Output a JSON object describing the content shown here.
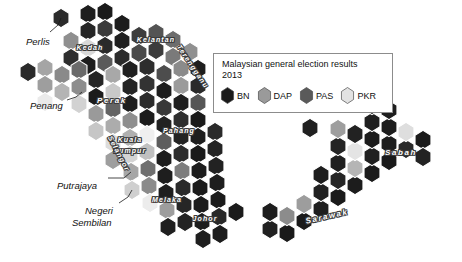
{
  "legend": {
    "title_line1": "Malaysian general election results",
    "title_line2": "2013",
    "items": [
      {
        "label": "BN",
        "color": "#1a1a1a"
      },
      {
        "label": "DAP",
        "color": "#9a9a9a"
      },
      {
        "label": "PAS",
        "color": "#5a5a5a"
      },
      {
        "label": "PKR",
        "color": "#e2e2e2"
      }
    ]
  },
  "labels_outside": [
    {
      "name": "perlis",
      "text": "Perlis",
      "x": 26,
      "y": 36,
      "w": 40
    },
    {
      "name": "penang",
      "text": "Penang",
      "x": 30,
      "y": 100,
      "w": 46
    },
    {
      "name": "putrajaya",
      "text": "Putrajaya",
      "x": 57,
      "y": 180,
      "w": 54
    },
    {
      "name": "negeri-sembilan-1",
      "text": "Negeri",
      "x": 85,
      "y": 205,
      "w": 44
    },
    {
      "name": "negeri-sembilan-2",
      "text": "Sembilan",
      "x": 72,
      "y": 217,
      "w": 58
    }
  ],
  "labels_inside": [
    {
      "name": "kedah",
      "text": "Kedah",
      "x": 66,
      "y": 44,
      "w": 48,
      "rot": 0,
      "size": "sm"
    },
    {
      "name": "kelantan",
      "text": "Kelantan",
      "x": 127,
      "y": 36,
      "w": 58,
      "rot": 0,
      "size": "sm"
    },
    {
      "name": "terengganu",
      "text": "Terengganu",
      "x": 160,
      "y": 63,
      "w": 66,
      "rot": 56,
      "size": "sm"
    },
    {
      "name": "perak",
      "text": "Perak",
      "x": 88,
      "y": 96,
      "w": 48,
      "rot": 0,
      "size": ""
    },
    {
      "name": "pahang",
      "text": "Pahang",
      "x": 153,
      "y": 127,
      "w": 52,
      "rot": 0,
      "size": "sm"
    },
    {
      "name": "kuala-lumpur-1",
      "text": "Kuala",
      "x": 111,
      "y": 136,
      "w": 38,
      "rot": 0,
      "size": "sm"
    },
    {
      "name": "kuala-lumpur-2",
      "text": "Lumpur",
      "x": 107,
      "y": 147,
      "w": 46,
      "rot": 0,
      "size": "sm"
    },
    {
      "name": "selangor",
      "text": "Selangor",
      "x": 94,
      "y": 150,
      "w": 50,
      "rot": 62,
      "size": "sm"
    },
    {
      "name": "melaka",
      "text": "Melaka",
      "x": 142,
      "y": 196,
      "w": 50,
      "rot": 0,
      "size": "sm"
    },
    {
      "name": "johor",
      "text": "Johor",
      "x": 185,
      "y": 215,
      "w": 40,
      "rot": 0,
      "size": "sm"
    },
    {
      "name": "sabah",
      "text": "Sabah",
      "x": 372,
      "y": 148,
      "w": 58,
      "rot": 0,
      "size": ""
    },
    {
      "name": "sarawak",
      "text": "Sarawak",
      "x": 292,
      "y": 212,
      "w": 70,
      "rot": -13,
      "size": ""
    }
  ],
  "map": {
    "hex_rx": 9.2,
    "hex_ry": 9.6,
    "stroke": "#ffffff",
    "stroke_width": 1.1,
    "leader_lines": [
      {
        "name": "leader-perlis",
        "pts": "50,32 58,25 61,18"
      },
      {
        "name": "leader-penang",
        "pts": "67,100 76,97 82,92"
      },
      {
        "name": "leader-putrajaya",
        "pts": "108,178 124,178 131,172"
      },
      {
        "name": "leader-negeri",
        "pts": "119,203 128,197 132,190"
      }
    ],
    "hexes": [
      {
        "x": 61,
        "y": 18,
        "c": "#2b2b2b"
      },
      {
        "x": 88,
        "y": 14,
        "c": "#1e1e1e"
      },
      {
        "x": 105,
        "y": 12,
        "c": "#1a1a1a"
      },
      {
        "x": 88,
        "y": 31,
        "c": "#262626"
      },
      {
        "x": 105,
        "y": 29,
        "c": "#3a3a3a"
      },
      {
        "x": 122,
        "y": 24,
        "c": "#1c1c1c"
      },
      {
        "x": 71,
        "y": 41,
        "c": "#8f8f8f"
      },
      {
        "x": 88,
        "y": 48,
        "c": "#d8d8d8"
      },
      {
        "x": 105,
        "y": 46,
        "c": "#2a2a2a"
      },
      {
        "x": 122,
        "y": 41,
        "c": "#1f1f1f"
      },
      {
        "x": 139,
        "y": 36,
        "c": "#3d3d3d"
      },
      {
        "x": 156,
        "y": 33,
        "c": "#545454"
      },
      {
        "x": 173,
        "y": 40,
        "c": "#6d6d6d"
      },
      {
        "x": 71,
        "y": 58,
        "c": "#2e2e2e"
      },
      {
        "x": 88,
        "y": 65,
        "c": "#1d1d1d"
      },
      {
        "x": 105,
        "y": 63,
        "c": "#5a5a5a"
      },
      {
        "x": 122,
        "y": 58,
        "c": "#2b2b2b"
      },
      {
        "x": 139,
        "y": 53,
        "c": "#4a4a4a"
      },
      {
        "x": 156,
        "y": 50,
        "c": "#3c3c3c"
      },
      {
        "x": 173,
        "y": 57,
        "c": "#7a7a7a"
      },
      {
        "x": 190,
        "y": 52,
        "c": "#909090"
      },
      {
        "x": 28,
        "y": 72,
        "c": "#2a2a2a"
      },
      {
        "x": 45,
        "y": 68,
        "c": "#a5a5a5"
      },
      {
        "x": 62,
        "y": 75,
        "c": "#8a8a8a"
      },
      {
        "x": 45,
        "y": 85,
        "c": "#9e9e9e"
      },
      {
        "x": 62,
        "y": 92,
        "c": "#b4b4b4"
      },
      {
        "x": 45,
        "y": 102,
        "c": "#eaeaea"
      },
      {
        "x": 79,
        "y": 70,
        "c": "#6a6a6a"
      },
      {
        "x": 96,
        "y": 80,
        "c": "#262626"
      },
      {
        "x": 113,
        "y": 75,
        "c": "#a8a8a8"
      },
      {
        "x": 130,
        "y": 70,
        "c": "#1f1f1f"
      },
      {
        "x": 147,
        "y": 67,
        "c": "#2d2d2d"
      },
      {
        "x": 164,
        "y": 74,
        "c": "#4d4d4d"
      },
      {
        "x": 181,
        "y": 69,
        "c": "#8b8b8b"
      },
      {
        "x": 198,
        "y": 69,
        "c": "#1e1e1e"
      },
      {
        "x": 79,
        "y": 87,
        "c": "#8d8d8d"
      },
      {
        "x": 96,
        "y": 97,
        "c": "#1b1b1b"
      },
      {
        "x": 113,
        "y": 92,
        "c": "#c9c9c9"
      },
      {
        "x": 130,
        "y": 87,
        "c": "#242424"
      },
      {
        "x": 147,
        "y": 84,
        "c": "#333333"
      },
      {
        "x": 164,
        "y": 91,
        "c": "#1e1e1e"
      },
      {
        "x": 181,
        "y": 86,
        "c": "#9b9b9b"
      },
      {
        "x": 198,
        "y": 86,
        "c": "#2a2a2a"
      },
      {
        "x": 79,
        "y": 104,
        "c": "#d2d2d2"
      },
      {
        "x": 96,
        "y": 114,
        "c": "#9a9a9a"
      },
      {
        "x": 113,
        "y": 109,
        "c": "#646464"
      },
      {
        "x": 130,
        "y": 104,
        "c": "#1d1d1d"
      },
      {
        "x": 147,
        "y": 101,
        "c": "#2b2b2b"
      },
      {
        "x": 164,
        "y": 108,
        "c": "#383838"
      },
      {
        "x": 181,
        "y": 103,
        "c": "#1f1f1f"
      },
      {
        "x": 198,
        "y": 103,
        "c": "#565656"
      },
      {
        "x": 96,
        "y": 131,
        "c": "#c6c6c6"
      },
      {
        "x": 113,
        "y": 126,
        "c": "#acacac"
      },
      {
        "x": 130,
        "y": 121,
        "c": "#8e8e8e"
      },
      {
        "x": 147,
        "y": 118,
        "c": "#1c1c1c"
      },
      {
        "x": 164,
        "y": 125,
        "c": "#222222"
      },
      {
        "x": 181,
        "y": 120,
        "c": "#2e2e2e"
      },
      {
        "x": 198,
        "y": 120,
        "c": "#1a1a1a"
      },
      {
        "x": 113,
        "y": 143,
        "c": "#dcdcdc"
      },
      {
        "x": 130,
        "y": 138,
        "c": "#b0b0b0"
      },
      {
        "x": 147,
        "y": 135,
        "c": "#efefef"
      },
      {
        "x": 164,
        "y": 142,
        "c": "#5e5e5e"
      },
      {
        "x": 181,
        "y": 137,
        "c": "#232323"
      },
      {
        "x": 198,
        "y": 137,
        "c": "#1e1e1e"
      },
      {
        "x": 215,
        "y": 132,
        "c": "#2a2a2a"
      },
      {
        "x": 113,
        "y": 160,
        "c": "#9e9e9e"
      },
      {
        "x": 130,
        "y": 155,
        "c": "#d4d4d4"
      },
      {
        "x": 147,
        "y": 152,
        "c": "#c0c0c0"
      },
      {
        "x": 164,
        "y": 159,
        "c": "#1d1d1d"
      },
      {
        "x": 181,
        "y": 154,
        "c": "#2c2c2c"
      },
      {
        "x": 198,
        "y": 154,
        "c": "#1a1a1a"
      },
      {
        "x": 215,
        "y": 149,
        "c": "#242424"
      },
      {
        "x": 131,
        "y": 172,
        "c": "#a6a6a6"
      },
      {
        "x": 148,
        "y": 169,
        "c": "#6f6f6f"
      },
      {
        "x": 165,
        "y": 176,
        "c": "#1e1e1e"
      },
      {
        "x": 182,
        "y": 171,
        "c": "#7d7d7d"
      },
      {
        "x": 199,
        "y": 171,
        "c": "#1c1c1c"
      },
      {
        "x": 216,
        "y": 166,
        "c": "#222222"
      },
      {
        "x": 132,
        "y": 190,
        "c": "#cfcfcf"
      },
      {
        "x": 149,
        "y": 186,
        "c": "#8b8b8b"
      },
      {
        "x": 166,
        "y": 193,
        "c": "#1f1f1f"
      },
      {
        "x": 183,
        "y": 188,
        "c": "#2a2a2a"
      },
      {
        "x": 200,
        "y": 188,
        "c": "#1b1b1b"
      },
      {
        "x": 217,
        "y": 183,
        "c": "#1e1e1e"
      },
      {
        "x": 150,
        "y": 203,
        "c": "#ececec"
      },
      {
        "x": 167,
        "y": 210,
        "c": "#9d9d9d"
      },
      {
        "x": 184,
        "y": 205,
        "c": "#262626"
      },
      {
        "x": 201,
        "y": 205,
        "c": "#1c1c1c"
      },
      {
        "x": 218,
        "y": 200,
        "c": "#1a1a1a"
      },
      {
        "x": 168,
        "y": 227,
        "c": "#1f1f1f"
      },
      {
        "x": 185,
        "y": 222,
        "c": "#232323"
      },
      {
        "x": 202,
        "y": 222,
        "c": "#1d1d1d"
      },
      {
        "x": 219,
        "y": 217,
        "c": "#282828"
      },
      {
        "x": 236,
        "y": 212,
        "c": "#1b1b1b"
      },
      {
        "x": 203,
        "y": 239,
        "c": "#1e1e1e"
      },
      {
        "x": 220,
        "y": 234,
        "c": "#1c1c1c"
      },
      {
        "x": 270,
        "y": 229,
        "c": "#202020"
      },
      {
        "x": 287,
        "y": 233,
        "c": "#1a1a1a"
      },
      {
        "x": 270,
        "y": 212,
        "c": "#1d1d1d"
      },
      {
        "x": 287,
        "y": 216,
        "c": "#8c8c8c"
      },
      {
        "x": 304,
        "y": 221,
        "c": "#1b1b1b"
      },
      {
        "x": 304,
        "y": 204,
        "c": "#9d9d9d"
      },
      {
        "x": 321,
        "y": 209,
        "c": "#1e1e1e"
      },
      {
        "x": 321,
        "y": 192,
        "c": "#212121"
      },
      {
        "x": 338,
        "y": 197,
        "c": "#1a1a1a"
      },
      {
        "x": 338,
        "y": 180,
        "c": "#242424"
      },
      {
        "x": 355,
        "y": 185,
        "c": "#1c1c1c"
      },
      {
        "x": 355,
        "y": 168,
        "c": "#b5b5b5"
      },
      {
        "x": 338,
        "y": 163,
        "c": "#1f1f1f"
      },
      {
        "x": 321,
        "y": 175,
        "c": "#1d1d1d"
      },
      {
        "x": 372,
        "y": 173,
        "c": "#1b1b1b"
      },
      {
        "x": 372,
        "y": 156,
        "c": "#202020"
      },
      {
        "x": 355,
        "y": 151,
        "c": "#e4e4e4"
      },
      {
        "x": 338,
        "y": 146,
        "c": "#242424"
      },
      {
        "x": 389,
        "y": 161,
        "c": "#1a1a1a"
      },
      {
        "x": 389,
        "y": 144,
        "c": "#1e1e1e"
      },
      {
        "x": 372,
        "y": 139,
        "c": "#1c1c1c"
      },
      {
        "x": 355,
        "y": 134,
        "c": "#222222"
      },
      {
        "x": 338,
        "y": 129,
        "c": "#9e9e9e"
      },
      {
        "x": 406,
        "y": 149,
        "c": "#2a2a2a"
      },
      {
        "x": 406,
        "y": 132,
        "c": "#dedede"
      },
      {
        "x": 389,
        "y": 127,
        "c": "#1d1d1d"
      },
      {
        "x": 372,
        "y": 122,
        "c": "#1f1f1f"
      },
      {
        "x": 423,
        "y": 140,
        "c": "#1b1b1b"
      },
      {
        "x": 423,
        "y": 157,
        "c": "#232323"
      },
      {
        "x": 389,
        "y": 110,
        "c": "#1e1e1e"
      },
      {
        "x": 372,
        "y": 105,
        "c": "#1c1c1c"
      },
      {
        "x": 310,
        "y": 128,
        "c": "#202020"
      }
    ]
  }
}
